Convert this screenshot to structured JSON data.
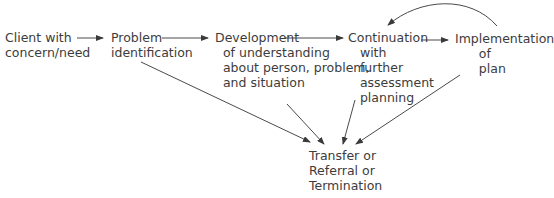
{
  "diagram": {
    "type": "flowchart",
    "nodes": [
      {
        "id": "client",
        "label": "Client with\nconcern/need"
      },
      {
        "id": "problem",
        "label": "Problem\nidentification"
      },
      {
        "id": "development",
        "label": "Development\n  of understanding\n  about person, problem,\n  and situation"
      },
      {
        "id": "continuation",
        "label": "Continuation\n   with\n   further\n   assessment\n   planning"
      },
      {
        "id": "implementation",
        "label": "Implementation\n      of\n      plan"
      },
      {
        "id": "outcome",
        "label": "Transfer or\nReferral or\nTermination"
      }
    ],
    "edges": [
      {
        "from": "client",
        "to": "problem"
      },
      {
        "from": "problem",
        "to": "development"
      },
      {
        "from": "development",
        "to": "continuation"
      },
      {
        "from": "continuation",
        "to": "implementation"
      },
      {
        "from": "implementation",
        "to": "continuation",
        "style": "curved"
      },
      {
        "from": "problem",
        "to": "outcome"
      },
      {
        "from": "development",
        "to": "outcome"
      },
      {
        "from": "continuation",
        "to": "outcome"
      },
      {
        "from": "implementation",
        "to": "outcome"
      }
    ]
  }
}
